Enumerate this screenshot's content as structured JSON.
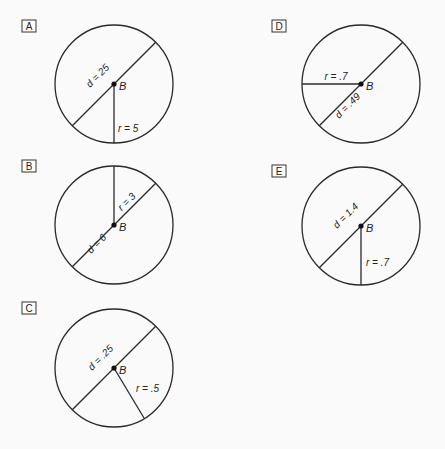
{
  "options": [
    {
      "letter": "A",
      "center_label": "B",
      "diameter_label": "d = 25",
      "radius_label": "r = 5"
    },
    {
      "letter": "B",
      "center_label": "B",
      "diameter_label": "d = 6",
      "radius_label": "r = 3"
    },
    {
      "letter": "C",
      "center_label": "B",
      "diameter_label": "d = .25",
      "radius_label": "r = .5"
    },
    {
      "letter": "D",
      "center_label": "B",
      "diameter_label": "d = .49",
      "radius_label": "r = .7"
    },
    {
      "letter": "E",
      "center_label": "B",
      "diameter_label": "d = 1.4",
      "radius_label": "r = .7"
    }
  ]
}
